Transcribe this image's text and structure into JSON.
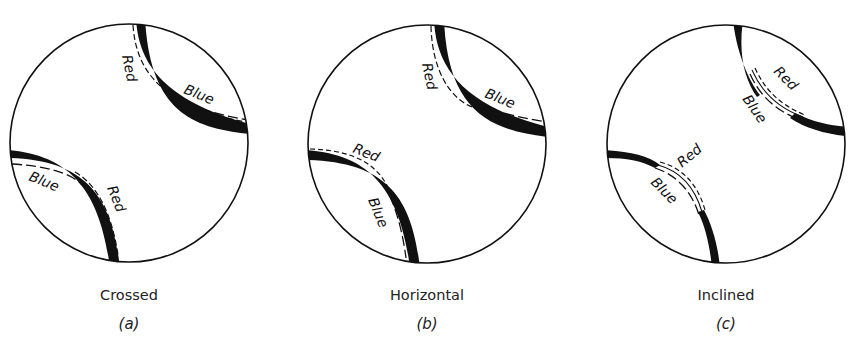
{
  "figure": {
    "panels": [
      {
        "id": "a",
        "caption": "Crossed",
        "sublabel": "(a)",
        "upper_fringe": {
          "outer_label": "Red",
          "inner_label": "Blue"
        },
        "lower_fringe": {
          "outer_label": "Red",
          "inner_label": "Blue"
        }
      },
      {
        "id": "b",
        "caption": "Horizontal",
        "sublabel": "(b)",
        "upper_fringe": {
          "outer_label": "Red",
          "inner_label": "Blue"
        },
        "lower_fringe": {
          "outer_label": "Red",
          "inner_label": "Blue"
        }
      },
      {
        "id": "c",
        "caption": "Inclined",
        "sublabel": "(c)",
        "upper_fringe": {
          "outer_label": "Red",
          "inner_label": "Blue"
        },
        "lower_fringe": {
          "outer_label": "Red",
          "inner_label": "Blue"
        }
      }
    ],
    "colors": {
      "ink": "#111111",
      "background": "#ffffff"
    }
  }
}
